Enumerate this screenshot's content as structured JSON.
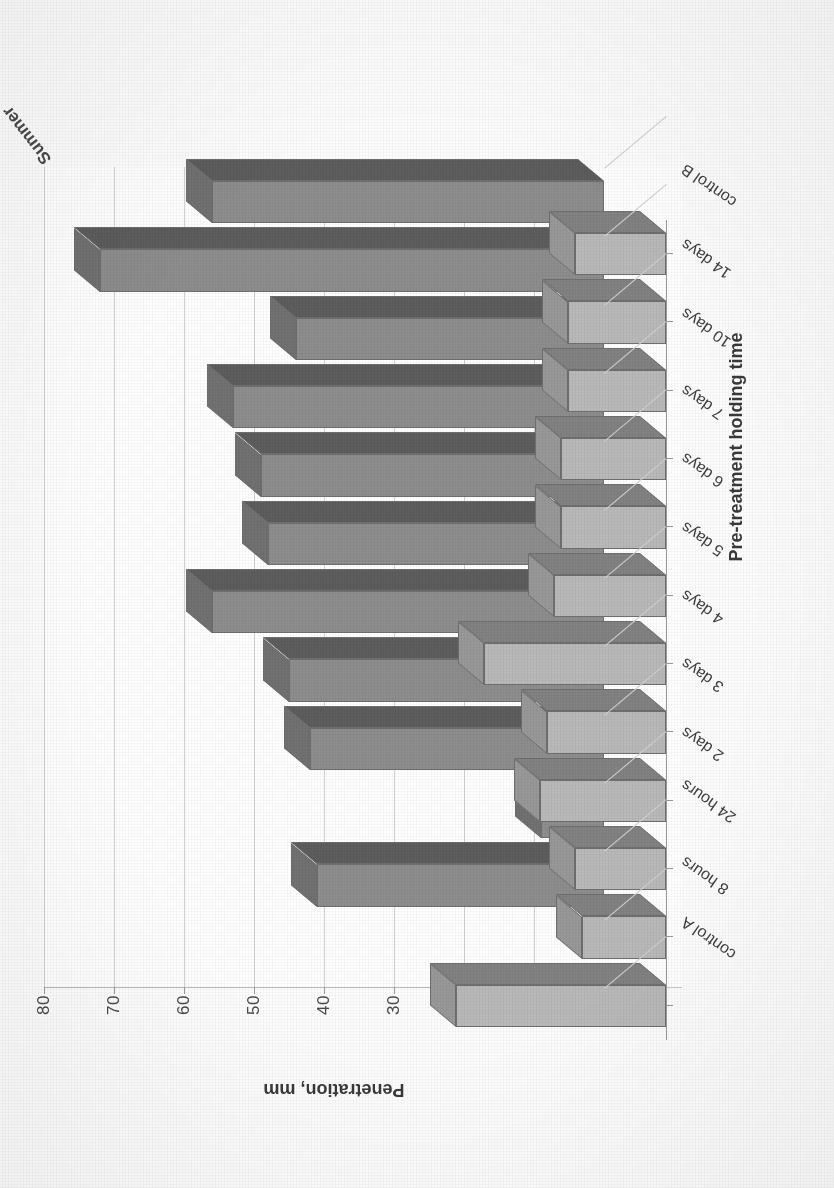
{
  "chart_data": {
    "type": "bar",
    "title": "",
    "subtitle": "",
    "orientation": "vertical-3d",
    "xlabel": "Pre-treatment holding time",
    "ylabel": "Penetration, mm",
    "ylim": [
      0,
      80
    ],
    "ytick_step": 10,
    "yticks": [
      "0",
      "10",
      "20",
      "30",
      "40",
      "50",
      "60",
      "70",
      "80"
    ],
    "grid": true,
    "legend_position": "depth-axis",
    "depth_axis_labels": [
      "Summer",
      "Winter"
    ],
    "categories": [
      "control A",
      "8 hours",
      "24 hours",
      "2 days",
      "3 days",
      "4 days",
      "5 days",
      "6 days",
      "7 days",
      "10 days",
      "14 days",
      "control B"
    ],
    "series": [
      {
        "name": "Summer",
        "color": "#b9b9b9",
        "values": [
          30,
          12,
          13,
          18,
          17,
          26,
          16,
          15,
          15,
          14,
          14,
          13
        ]
      },
      {
        "name": "Winter",
        "color": "#8d8d8d",
        "values": [
          0,
          41,
          9,
          42,
          45,
          56,
          48,
          49,
          53,
          44,
          72,
          56
        ]
      }
    ]
  },
  "axes": {
    "value_axis_title": "Penetration, mm",
    "category_axis_title": "Pre-treatment holding time"
  }
}
